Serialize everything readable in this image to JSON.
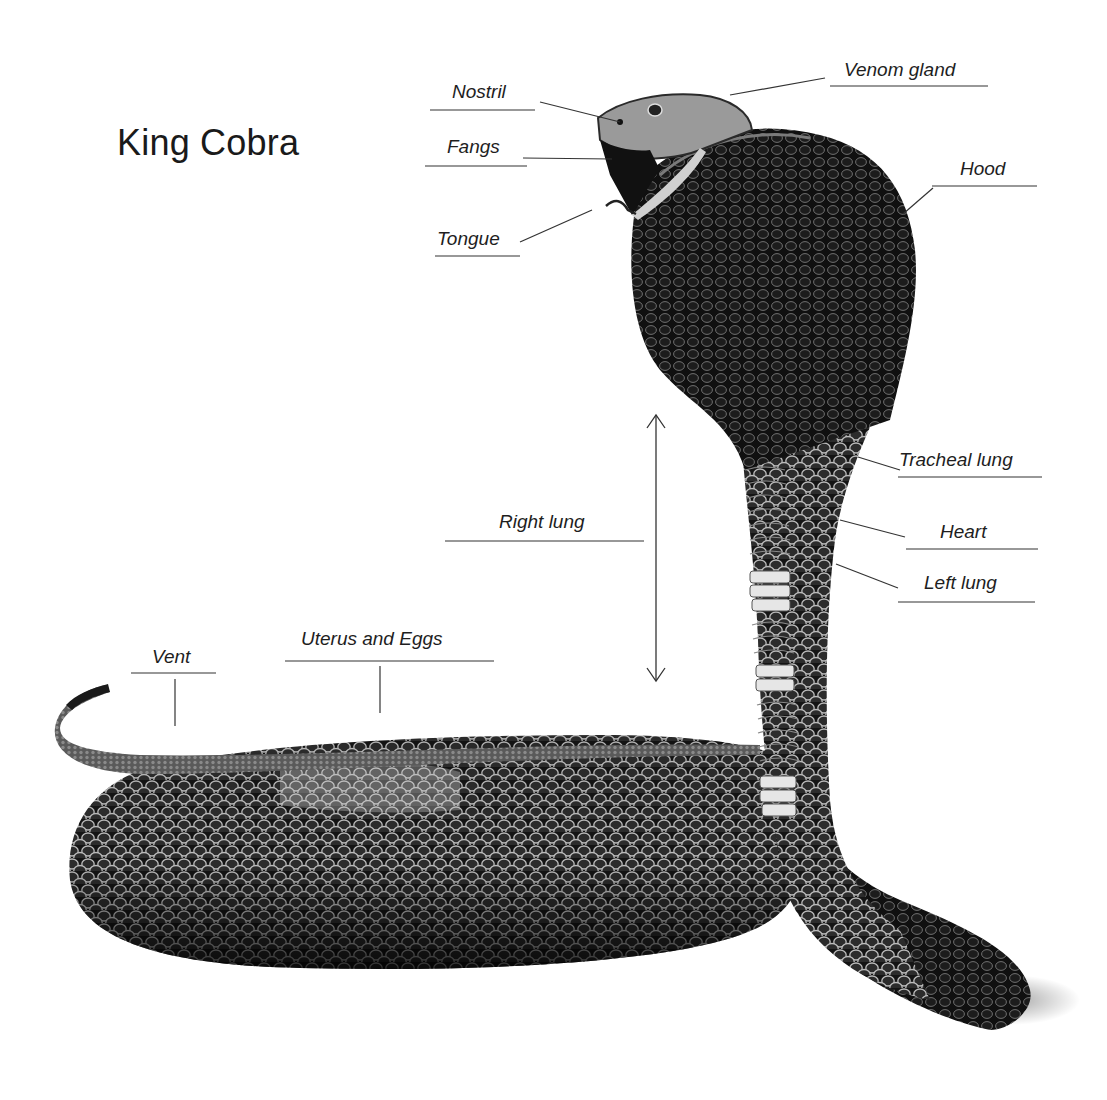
{
  "title": "King Cobra",
  "colors": {
    "background": "#ffffff",
    "snake_body": "#141414",
    "scale_highlight": "#d8d8d8",
    "belly_band": "#e6e6e6",
    "label_text": "#1e1e1e",
    "leader_line": "#333333"
  },
  "labels": {
    "nostril": "Nostril",
    "fangs": "Fangs",
    "tongue": "Tongue",
    "venom_gland": "Venom gland",
    "hood": "Hood",
    "tracheal_lung": "Tracheal lung",
    "heart": "Heart",
    "left_lung": "Left lung",
    "right_lung": "Right lung",
    "uterus_and_eggs": "Uterus and Eggs",
    "vent": "Vent"
  },
  "icons": {
    "right_lung_extent": "double-headed-vertical-arrow"
  }
}
